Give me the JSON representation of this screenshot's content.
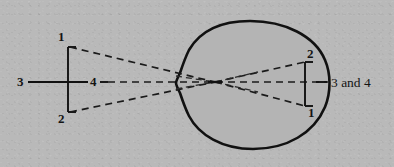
{
  "figure": {
    "type": "optical-ray-diagram",
    "background_color": "#b9b9b9",
    "ink_color": "#121212",
    "eye_fill_color": "#b4b4b4"
  },
  "object": {
    "name": "object-arrow",
    "labels": {
      "top": "1",
      "bottom": "2",
      "axis_left": "3",
      "axis_mid": "4"
    }
  },
  "image": {
    "name": "retinal-image",
    "labels": {
      "top": "2",
      "bottom": "1",
      "axis": "3 and 4"
    }
  },
  "rays": {
    "count": 4,
    "style": "dashed",
    "nodal_point_label": ""
  },
  "labels": [
    {
      "id": "object-point-1",
      "text": "1",
      "x": 58,
      "y": 30
    },
    {
      "id": "object-point-2",
      "text": "2",
      "x": 58,
      "y": 112
    },
    {
      "id": "object-point-3",
      "text": "3",
      "x": 17,
      "y": 75
    },
    {
      "id": "object-point-4",
      "text": "4",
      "x": 90,
      "y": 75
    },
    {
      "id": "image-point-2",
      "text": "2",
      "x": 307,
      "y": 47
    },
    {
      "id": "image-point-1",
      "text": "1",
      "x": 308,
      "y": 106
    },
    {
      "id": "image-point-3-and-4",
      "text": "3 and 4",
      "x": 331,
      "y": 76
    }
  ]
}
